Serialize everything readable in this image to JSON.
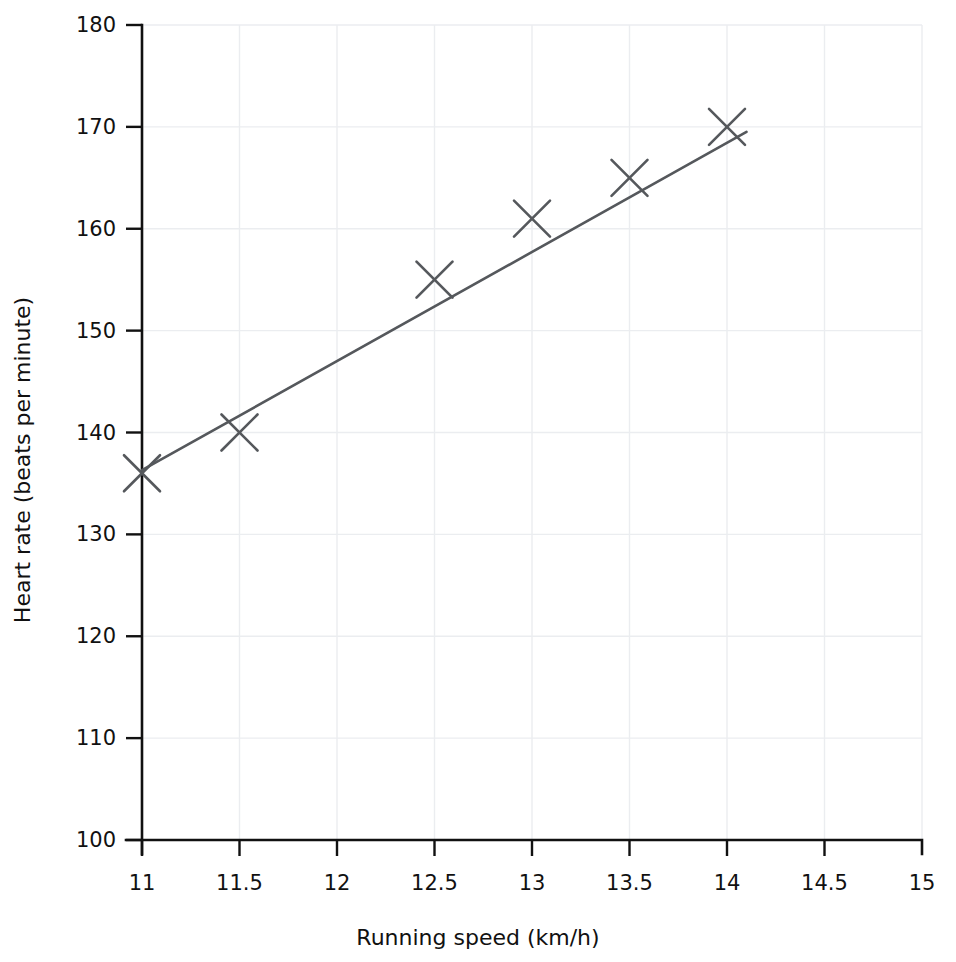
{
  "chart_data": {
    "type": "scatter",
    "title": "",
    "subtitle": "",
    "xlabel": "Running speed (km/h)",
    "ylabel": "Heart rate (beats per minute)",
    "xlim": [
      11,
      15
    ],
    "ylim": [
      100,
      180
    ],
    "grid": true,
    "legend": "none",
    "x_ticks": [
      11,
      11.5,
      12,
      12.5,
      13,
      13.5,
      14,
      14.5,
      15
    ],
    "x_tick_labels": [
      "11",
      "11.5",
      "12",
      "12.5",
      "13",
      "13.5",
      "14",
      "14.5",
      "15"
    ],
    "y_ticks": [
      100,
      110,
      120,
      130,
      140,
      150,
      160,
      170,
      180
    ],
    "y_tick_labels": [
      "100",
      "110",
      "120",
      "130",
      "140",
      "150",
      "160",
      "170",
      "180"
    ],
    "series": [
      {
        "name": "Observations",
        "marker": "x-cross",
        "color": "#55585c",
        "points": [
          {
            "x": 11.0,
            "y": 136
          },
          {
            "x": 11.5,
            "y": 140
          },
          {
            "x": 12.5,
            "y": 155
          },
          {
            "x": 13.0,
            "y": 161
          },
          {
            "x": 13.5,
            "y": 165
          },
          {
            "x": 14.0,
            "y": 170
          }
        ]
      },
      {
        "name": "Line of best fit",
        "marker": "line",
        "color": "#55585c",
        "points": [
          {
            "x": 11.0,
            "y": 136.3
          },
          {
            "x": 14.1,
            "y": 169.5
          }
        ]
      }
    ],
    "annotations": []
  },
  "colors": {
    "axis": "#111111",
    "grid": "#ebedf0",
    "data": "#55585c",
    "background": "#ffffff"
  }
}
